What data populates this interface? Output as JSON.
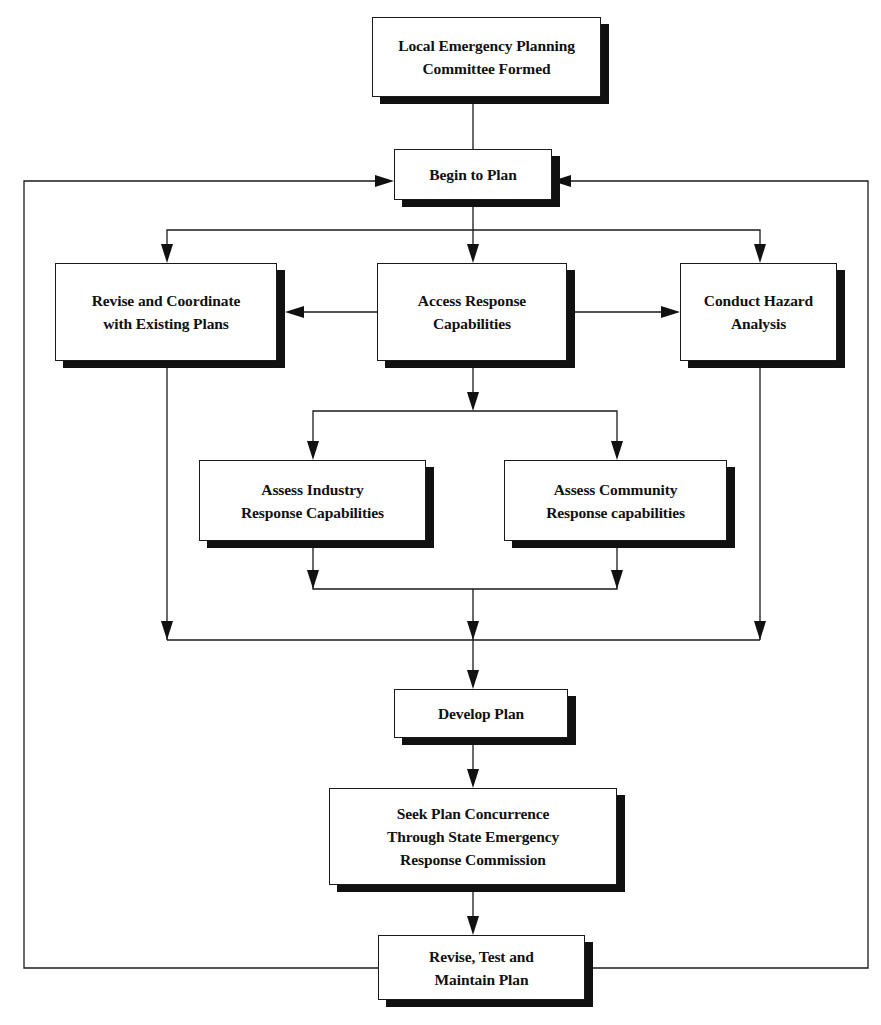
{
  "diagram": {
    "type": "flowchart",
    "nodes": [
      {
        "id": "lepc-formed",
        "label": "Local Emergency Planning\nCommittee Formed"
      },
      {
        "id": "begin-plan",
        "label": "Begin to Plan"
      },
      {
        "id": "revise-coordinate",
        "label": "Revise and Coordinate\nwith Existing Plans"
      },
      {
        "id": "access-response",
        "label": "Access Response\nCapabilities"
      },
      {
        "id": "conduct-hazard",
        "label": "Conduct Hazard\nAnalysis"
      },
      {
        "id": "assess-industry",
        "label": "Assess Industry\nResponse Capabilities"
      },
      {
        "id": "assess-community",
        "label": "Assess Community\nResponse capabilities"
      },
      {
        "id": "develop-plan",
        "label": "Develop Plan"
      },
      {
        "id": "seek-concurrence",
        "label": "Seek Plan Concurrence\nThrough State Emergency\nResponse Commission"
      },
      {
        "id": "revise-test-maintain",
        "label": "Revise, Test and\nMaintain Plan"
      }
    ],
    "edges": [
      {
        "from": "lepc-formed",
        "to": "begin-plan"
      },
      {
        "from": "begin-plan",
        "to": "revise-coordinate"
      },
      {
        "from": "begin-plan",
        "to": "access-response"
      },
      {
        "from": "begin-plan",
        "to": "conduct-hazard"
      },
      {
        "from": "access-response",
        "to": "revise-coordinate"
      },
      {
        "from": "access-response",
        "to": "conduct-hazard"
      },
      {
        "from": "access-response",
        "to": "assess-industry"
      },
      {
        "from": "access-response",
        "to": "assess-community"
      },
      {
        "from": "assess-industry",
        "to": "develop-plan"
      },
      {
        "from": "assess-community",
        "to": "develop-plan"
      },
      {
        "from": "revise-coordinate",
        "to": "develop-plan"
      },
      {
        "from": "conduct-hazard",
        "to": "develop-plan"
      },
      {
        "from": "develop-plan",
        "to": "seek-concurrence"
      },
      {
        "from": "seek-concurrence",
        "to": "revise-test-maintain"
      },
      {
        "from": "revise-test-maintain",
        "to": "begin-plan",
        "note": "feedback loop (left side)"
      },
      {
        "from": "revise-test-maintain",
        "to": "begin-plan",
        "note": "feedback loop (right side)"
      }
    ]
  }
}
